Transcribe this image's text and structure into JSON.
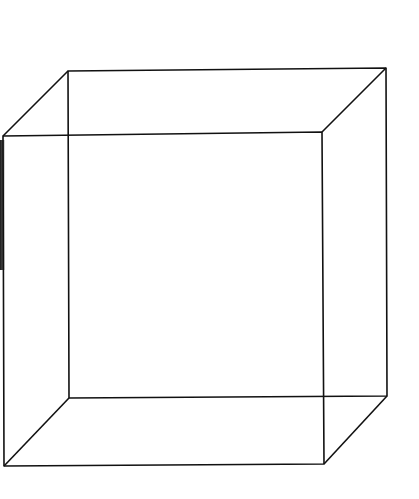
{
  "diagram": {
    "type": "wireframe-cube",
    "stroke_color": "#111111",
    "background": "#ffffff",
    "back_face": {
      "tl": [
        68,
        71
      ],
      "tr": [
        386,
        68
      ],
      "br": [
        387,
        396
      ],
      "bl": [
        69,
        398
      ]
    },
    "front_face": {
      "tl": [
        3,
        136
      ],
      "tr": [
        322,
        132
      ],
      "br": [
        324,
        464
      ],
      "bl": [
        4,
        466
      ]
    }
  }
}
